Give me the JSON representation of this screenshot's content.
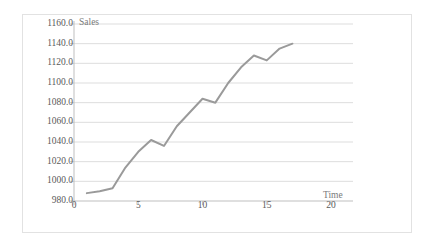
{
  "chart_data": {
    "type": "line",
    "title": "",
    "xlabel": "Time",
    "ylabel": "Sales",
    "xlim": [
      0,
      20
    ],
    "ylim": [
      980,
      1160
    ],
    "xticks": [
      "0",
      "5",
      "10",
      "15",
      "20"
    ],
    "xtick_values": [
      0,
      5,
      10,
      15,
      20
    ],
    "yticks": [
      "980.0",
      "1000.0",
      "1020.0",
      "1040.0",
      "1060.0",
      "1080.0",
      "1100.0",
      "1120.0",
      "1140.0",
      "1160.0"
    ],
    "ytick_values": [
      980,
      1000,
      1020,
      1040,
      1060,
      1080,
      1100,
      1120,
      1140,
      1160
    ],
    "grid": "horizontal",
    "legend": "none",
    "series": [
      {
        "name": "Sales",
        "color": "#9a9a9a",
        "x": [
          1,
          2,
          3,
          4,
          5,
          6,
          7,
          8,
          9,
          10,
          11,
          12,
          13,
          14,
          15,
          16,
          17
        ],
        "values": [
          988,
          990,
          993,
          1014,
          1030,
          1042,
          1036,
          1056,
          1070,
          1084,
          1080,
          1100,
          1116,
          1128,
          1123,
          1135,
          1140
        ]
      }
    ]
  },
  "style": {
    "line_color": "#9a9a9a",
    "grid_color": "#d9d9d9",
    "axis_color": "#bfbfbf",
    "text_color": "#5a5a5a",
    "border_color": "#e2e2e2",
    "background": "#ffffff"
  }
}
